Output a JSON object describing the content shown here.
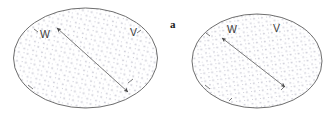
{
  "figure": {
    "panel_label": "a",
    "background_color": "#ffffff",
    "outline_color": "#5d5d5d",
    "stipple_color": "#b9b9c8",
    "arrow_color": "#7a7a7a",
    "arrowhead_color": "#4a4a4a",
    "label_color": "#3a3a3a",
    "panels": [
      {
        "id": "left-ellipse",
        "name": "left-domain-ellipse",
        "cx": 85.5,
        "cy": 58,
        "rx": 72,
        "ry": 50,
        "labels": [
          {
            "text": "W",
            "x": 40,
            "y": 38
          },
          {
            "text": "V",
            "x": 130,
            "y": 36
          }
        ],
        "arrow": {
          "x1": 57,
          "y1": 28,
          "x2": 128,
          "y2": 92,
          "double_headed": true
        },
        "ticks": [
          {
            "x1": 28,
            "y1": 85,
            "x2": 33,
            "y2": 89
          },
          {
            "x1": 128,
            "y1": 83,
            "x2": 133,
            "y2": 79
          },
          {
            "x1": 34,
            "y1": 29,
            "x2": 38,
            "y2": 32
          },
          {
            "x1": 141,
            "y1": 30,
            "x2": 137,
            "y2": 33
          }
        ]
      },
      {
        "id": "right-ellipse",
        "name": "right-domain-ellipse",
        "cx": 257,
        "cy": 61,
        "rx": 65,
        "ry": 47,
        "labels": [
          {
            "text": "W",
            "x": 227,
            "y": 33
          },
          {
            "text": "V",
            "x": 273,
            "y": 32
          }
        ],
        "arrow": {
          "x1": 222,
          "y1": 38,
          "x2": 285,
          "y2": 87,
          "double_headed": true
        },
        "ticks": [
          {
            "x1": 205,
            "y1": 85,
            "x2": 210,
            "y2": 89
          },
          {
            "x1": 281,
            "y1": 90,
            "x2": 285,
            "y2": 86
          },
          {
            "x1": 229,
            "y1": 101,
            "x2": 232,
            "y2": 98
          },
          {
            "x1": 206,
            "y1": 33,
            "x2": 210,
            "y2": 36
          }
        ]
      }
    ]
  }
}
